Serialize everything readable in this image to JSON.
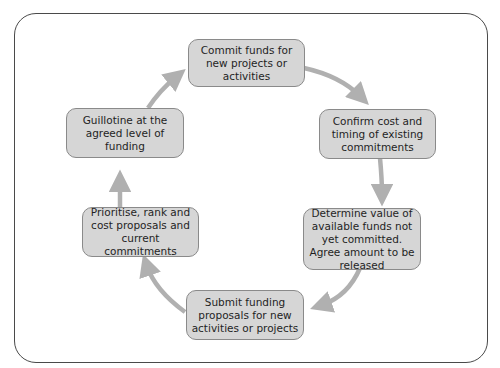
{
  "diagram": {
    "type": "cycle",
    "colors": {
      "box_fill": "#d6d6d6",
      "box_border": "#8a8a8a",
      "arrow": "#b0b0b0",
      "frame": "#4a4a4a",
      "text": "#1f1f1f"
    },
    "steps": [
      {
        "id": "commit",
        "label": "Commit funds for new projects or activities"
      },
      {
        "id": "confirm",
        "label": "Confirm cost and timing of existing commitments"
      },
      {
        "id": "determine",
        "label": "Determine value of available funds not yet committed. Agree amount to be released"
      },
      {
        "id": "submit",
        "label": "Submit funding proposals for new activities or projects"
      },
      {
        "id": "prioritise",
        "label": "Prioritise, rank and cost proposals and current commitments"
      },
      {
        "id": "guillotine",
        "label": "Guillotine at the agreed level of funding"
      }
    ],
    "flow": [
      "commit",
      "confirm",
      "determine",
      "submit",
      "prioritise",
      "guillotine",
      "commit"
    ]
  }
}
